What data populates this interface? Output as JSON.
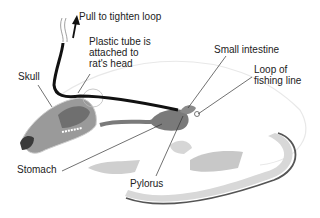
{
  "diagram": {
    "labels": {
      "pull": "Pull to tighten loop",
      "tube": "Plastic tube is\nattached to\nrat's head",
      "skull": "Skull",
      "small_intestine": "Small intestine",
      "loop": "Loop of\nfishing line",
      "stomach": "Stomach",
      "pylorus": "Pylorus"
    },
    "colors": {
      "tube": "#111111",
      "organ": "#7a7a7a",
      "skull": "#9a9a9a",
      "body_outline": "#e6e6e6",
      "fur_shadow": "#c8c8c8",
      "tail": "#d8d8d8",
      "tail_edge": "#555555",
      "leader": "#333333",
      "text": "#222222"
    }
  }
}
